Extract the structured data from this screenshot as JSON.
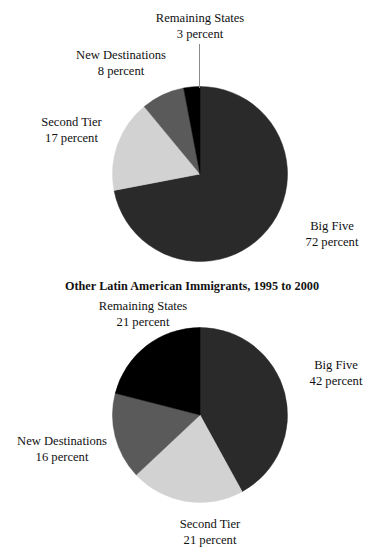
{
  "figure": {
    "background_color": "#ffffff",
    "text_color": "#111111"
  },
  "palette": {
    "big_five": "#2a2a2a",
    "second_tier": "#d2d2d2",
    "new_destinations": "#5a5a5a",
    "remaining_states": "#000000",
    "leader_line": "#8b8b8b"
  },
  "charts": [
    {
      "id": "chart-1",
      "title": "Mexican Immigrants, 1995 to 2000",
      "title_visible": false,
      "labels": {
        "big_five": {
          "name": "Big Five",
          "value": "72 percent"
        },
        "second_tier": {
          "name": "Second Tier",
          "value": "17 percent"
        },
        "new_destinations": {
          "name": "New Destinations",
          "value": "8 percent"
        },
        "remaining_states": {
          "name": "Remaining States",
          "value": "3 percent"
        }
      }
    },
    {
      "id": "chart-2",
      "title": "Other Latin American Immigrants, 1995 to 2000",
      "title_visible": true,
      "labels": {
        "big_five": {
          "name": "Big Five",
          "value": "42 percent"
        },
        "second_tier": {
          "name": "Second Tier",
          "value": "21 percent"
        },
        "new_destinations": {
          "name": "New Destinations",
          "value": "16 percent"
        },
        "remaining_states": {
          "name": "Remaining States",
          "value": "21 percent"
        }
      }
    }
  ],
  "chart_data": [
    {
      "type": "pie",
      "title": "Mexican Immigrants, 1995 to 2000",
      "title_clipped": true,
      "categories": [
        "Big Five",
        "Second Tier",
        "New Destinations",
        "Remaining States"
      ],
      "values": [
        72,
        17,
        8,
        3
      ],
      "unit": "percent",
      "colors": [
        "#2a2a2a",
        "#d2d2d2",
        "#5a5a5a",
        "#000000"
      ],
      "start_angle_deg": 0,
      "direction": "clockwise",
      "legend": "none",
      "labels_inline": true,
      "center_px": [
        200,
        174
      ],
      "radius_px": 88
    },
    {
      "type": "pie",
      "title": "Other Latin American Immigrants, 1995 to 2000",
      "title_clipped": false,
      "categories": [
        "Big Five",
        "Second Tier",
        "New Destinations",
        "Remaining States"
      ],
      "values": [
        42,
        21,
        16,
        21
      ],
      "unit": "percent",
      "colors": [
        "#2a2a2a",
        "#d2d2d2",
        "#5a5a5a",
        "#000000"
      ],
      "start_angle_deg": 0,
      "direction": "clockwise",
      "legend": "none",
      "labels_inline": true,
      "center_px": [
        200,
        415
      ],
      "radius_px": 88
    }
  ]
}
